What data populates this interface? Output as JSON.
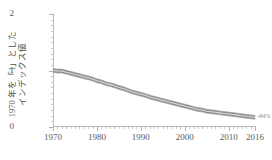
{
  "chart_data": {
    "type": "line",
    "title": "",
    "subtitle": "",
    "xlabel": "",
    "ylabel": "1970年を「1」としたインデックス値",
    "ylabel_lines": [
      "1970 年を「1」とした",
      "インデックス値"
    ],
    "xlim": [
      1970,
      2016
    ],
    "ylim": [
      0,
      2
    ],
    "grid": false,
    "legend": "none",
    "band_style": "thick gray band with light center line",
    "colors": {
      "band": "#8d8d8d",
      "band_edge": "#a6a6a6",
      "center_line": "#d9d9d9",
      "axis": "#b9b9b9",
      "tick_label": "#5a5a5a",
      "annotation": "#8f8f8f"
    },
    "y_ticks_major": [
      0,
      1,
      2
    ],
    "y_tick_labels": [
      "0",
      "1",
      "2"
    ],
    "y_ticks_minor_step": 0.1,
    "x_ticks_major": [
      1970,
      1980,
      1990,
      2000,
      2010,
      2016
    ],
    "x_tick_labels": [
      "1970",
      "1980",
      "1990",
      "2000",
      "2010",
      "2016"
    ],
    "x_ticks_minor_step": 1,
    "annotations": [
      {
        "name": "end-value-label",
        "text": "-84%",
        "x": 2016,
        "y": 0.17
      }
    ],
    "series": [
      {
        "name": "index",
        "x": [
          1970,
          1971,
          1972,
          1973,
          1974,
          1975,
          1976,
          1977,
          1978,
          1979,
          1980,
          1981,
          1982,
          1983,
          1984,
          1985,
          1986,
          1987,
          1988,
          1989,
          1990,
          1991,
          1992,
          1993,
          1994,
          1995,
          1996,
          1997,
          1998,
          1999,
          2000,
          2001,
          2002,
          2003,
          2004,
          2005,
          2006,
          2007,
          2008,
          2009,
          2010,
          2011,
          2012,
          2013,
          2014,
          2015,
          2016
        ],
        "values": [
          1.0,
          0.99,
          0.99,
          0.97,
          0.95,
          0.93,
          0.91,
          0.89,
          0.87,
          0.85,
          0.82,
          0.8,
          0.77,
          0.75,
          0.73,
          0.7,
          0.68,
          0.65,
          0.62,
          0.6,
          0.58,
          0.56,
          0.53,
          0.51,
          0.49,
          0.47,
          0.45,
          0.43,
          0.41,
          0.39,
          0.37,
          0.35,
          0.33,
          0.31,
          0.3,
          0.28,
          0.27,
          0.26,
          0.25,
          0.24,
          0.23,
          0.22,
          0.21,
          0.2,
          0.19,
          0.18,
          0.17
        ],
        "band_half_width": 0.035
      }
    ]
  }
}
